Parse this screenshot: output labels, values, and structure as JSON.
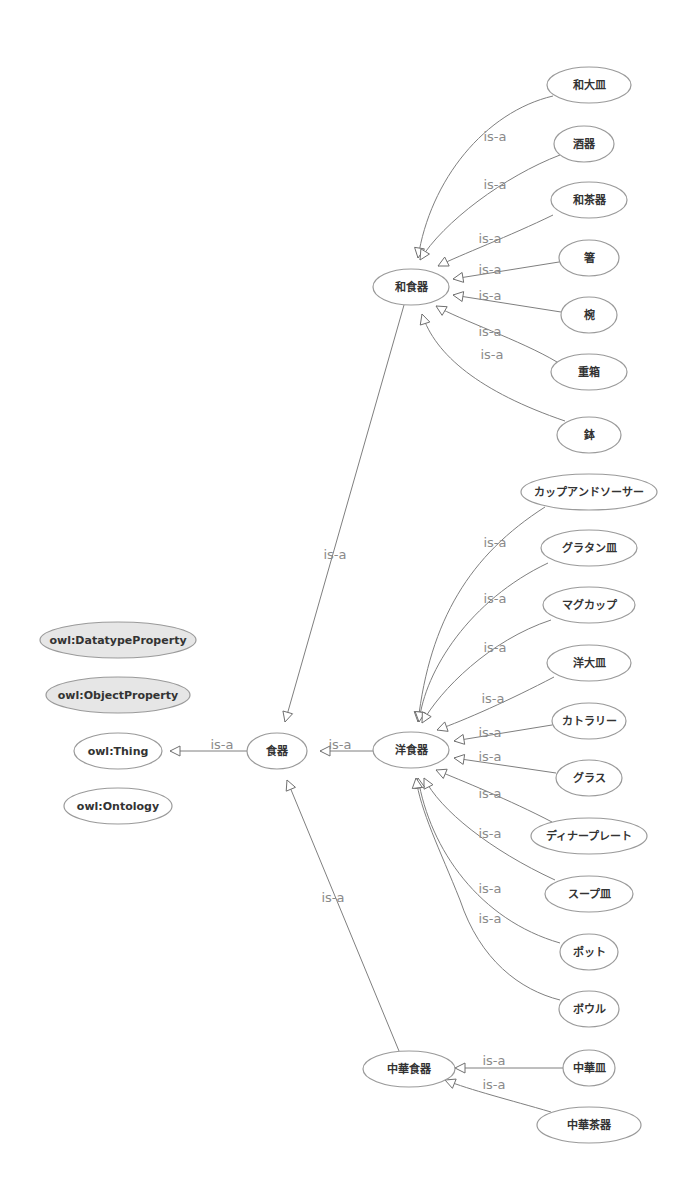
{
  "diagram": {
    "type": "ontology-class-hierarchy",
    "edge_label": "is-a",
    "colors": {
      "background": "#ffffff",
      "node_stroke": "#9a9a9a",
      "node_fill": "#ffffff",
      "property_node_fill": "#e6e6e6",
      "edge": "#7f7f7f",
      "edge_label": "#8a8a8a",
      "node_text": "#333333"
    },
    "nodes": [
      {
        "id": "dtprop",
        "label": "owl:DatatypeProperty",
        "cx": 118,
        "cy": 640,
        "rx": 78,
        "ry": 18,
        "shaded": true
      },
      {
        "id": "objprop",
        "label": "owl:ObjectProperty",
        "cx": 118,
        "cy": 695,
        "rx": 72,
        "ry": 18,
        "shaded": true
      },
      {
        "id": "thing",
        "label": "owl:Thing",
        "cx": 118,
        "cy": 751,
        "rx": 44,
        "ry": 18,
        "shaded": false
      },
      {
        "id": "ontology",
        "label": "owl:Ontology",
        "cx": 118,
        "cy": 806,
        "rx": 54,
        "ry": 18,
        "shaded": false
      },
      {
        "id": "shokki",
        "label": "食器",
        "cx": 277,
        "cy": 751,
        "rx": 30,
        "ry": 18,
        "shaded": false
      },
      {
        "id": "washokki",
        "label": "和食器",
        "cx": 411,
        "cy": 287,
        "rx": 38,
        "ry": 18,
        "shaded": false
      },
      {
        "id": "yoshokki",
        "label": "洋食器",
        "cx": 411,
        "cy": 750,
        "rx": 38,
        "ry": 18,
        "shaded": false
      },
      {
        "id": "chukashokki",
        "label": "中華食器",
        "cx": 409,
        "cy": 1069,
        "rx": 46,
        "ry": 18,
        "shaded": false
      },
      {
        "id": "waozara",
        "label": "和大皿",
        "cx": 589,
        "cy": 85,
        "rx": 42,
        "ry": 18,
        "shaded": false
      },
      {
        "id": "shuki",
        "label": "酒器",
        "cx": 584,
        "cy": 144,
        "rx": 30,
        "ry": 18,
        "shaded": false
      },
      {
        "id": "wachaki",
        "label": "和茶器",
        "cx": 589,
        "cy": 200,
        "rx": 38,
        "ry": 18,
        "shaded": false
      },
      {
        "id": "hashi",
        "label": "箸",
        "cx": 589,
        "cy": 258,
        "rx": 30,
        "ry": 18,
        "shaded": false
      },
      {
        "id": "wan",
        "label": "椀",
        "cx": 589,
        "cy": 315,
        "rx": 28,
        "ry": 18,
        "shaded": false
      },
      {
        "id": "jubako",
        "label": "重箱",
        "cx": 589,
        "cy": 372,
        "rx": 38,
        "ry": 18,
        "shaded": false
      },
      {
        "id": "hachi",
        "label": "鉢",
        "cx": 589,
        "cy": 435,
        "rx": 32,
        "ry": 18,
        "shaded": false
      },
      {
        "id": "cup_saucer",
        "label": "カップアンドソーサー",
        "cx": 589,
        "cy": 492,
        "rx": 68,
        "ry": 18,
        "shaded": false
      },
      {
        "id": "gratin",
        "label": "グラタン皿",
        "cx": 589,
        "cy": 548,
        "rx": 48,
        "ry": 18,
        "shaded": false
      },
      {
        "id": "mug",
        "label": "マグカップ",
        "cx": 589,
        "cy": 605,
        "rx": 46,
        "ry": 18,
        "shaded": false
      },
      {
        "id": "yoozara",
        "label": "洋大皿",
        "cx": 589,
        "cy": 663,
        "rx": 42,
        "ry": 18,
        "shaded": false
      },
      {
        "id": "cutlery",
        "label": "カトラリー",
        "cx": 589,
        "cy": 721,
        "rx": 37,
        "ry": 18,
        "shaded": false
      },
      {
        "id": "glass",
        "label": "グラス",
        "cx": 589,
        "cy": 778,
        "rx": 33,
        "ry": 18,
        "shaded": false
      },
      {
        "id": "dinner",
        "label": "ディナープレート",
        "cx": 589,
        "cy": 836,
        "rx": 58,
        "ry": 18,
        "shaded": false
      },
      {
        "id": "soup",
        "label": "スープ皿",
        "cx": 589,
        "cy": 894,
        "rx": 44,
        "ry": 18,
        "shaded": false
      },
      {
        "id": "pot",
        "label": "ポット",
        "cx": 589,
        "cy": 952,
        "rx": 29,
        "ry": 18,
        "shaded": false
      },
      {
        "id": "bowl",
        "label": "ボウル",
        "cx": 589,
        "cy": 1009,
        "rx": 30,
        "ry": 18,
        "shaded": false
      },
      {
        "id": "chukazara",
        "label": "中華皿",
        "cx": 589,
        "cy": 1068,
        "rx": 26,
        "ry": 18,
        "shaded": false
      },
      {
        "id": "chukachaki",
        "label": "中華茶器",
        "cx": 589,
        "cy": 1125,
        "rx": 52,
        "ry": 18,
        "shaded": false
      }
    ],
    "edges": [
      {
        "from": "shokki",
        "to": "thing",
        "label": "is-a",
        "path": "M247,751 L170,751",
        "lx": 222,
        "ly": 744
      },
      {
        "from": "yoshokki",
        "to": "shokki",
        "label": "is-a",
        "path": "M373,751 L320,751",
        "lx": 340,
        "ly": 744
      },
      {
        "from": "washokki",
        "to": "shokki",
        "label": "is-a",
        "path": "M404,305 L285,722",
        "lx": 335,
        "ly": 554
      },
      {
        "from": "chukashokki",
        "to": "shokki",
        "label": "is-a",
        "path": "M399,1051 L287,780",
        "lx": 333,
        "ly": 897
      },
      {
        "from": "waozara",
        "to": "washokki",
        "label": "is-a",
        "path": "M553,96 C485,112 430,180 418,258",
        "lx": 495,
        "ly": 136
      },
      {
        "from": "shuki",
        "to": "washokki",
        "label": "is-a",
        "path": "M560,155 C505,176 443,222 420,260",
        "lx": 495,
        "ly": 184
      },
      {
        "from": "wachaki",
        "to": "washokki",
        "label": "is-a",
        "path": "M553,215 C510,236 460,255 438,266",
        "lx": 490,
        "ly": 238
      },
      {
        "from": "hashi",
        "to": "washokki",
        "label": "is-a",
        "path": "M559,262 L453,279",
        "lx": 490,
        "ly": 269
      },
      {
        "from": "wan",
        "to": "washokki",
        "label": "is-a",
        "path": "M561,312 L453,295",
        "lx": 490,
        "ly": 295
      },
      {
        "from": "jubako",
        "to": "washokki",
        "label": "is-a",
        "path": "M557,362 C520,340 460,320 436,306",
        "lx": 490,
        "ly": 331
      },
      {
        "from": "hachi",
        "to": "washokki",
        "label": "is-a",
        "path": "M565,421 C480,392 435,355 422,314",
        "lx": 492,
        "ly": 354
      },
      {
        "from": "cup_saucer",
        "to": "yoshokki",
        "label": "is-a",
        "path": "M545,507 C470,555 430,620 418,722",
        "lx": 495,
        "ly": 542
      },
      {
        "from": "gratin",
        "to": "yoshokki",
        "label": "is-a",
        "path": "M548,563 C470,600 425,670 419,722",
        "lx": 495,
        "ly": 598
      },
      {
        "from": "mug",
        "to": "yoshokki",
        "label": "is-a",
        "path": "M551,620 C490,640 440,690 422,723",
        "lx": 495,
        "ly": 647
      },
      {
        "from": "yoozara",
        "to": "yoshokki",
        "label": "is-a",
        "path": "M554,677 C510,700 465,720 437,730",
        "lx": 493,
        "ly": 698
      },
      {
        "from": "cutlery",
        "to": "yoshokki",
        "label": "is-a",
        "path": "M552,725 L454,741",
        "lx": 490,
        "ly": 732
      },
      {
        "from": "glass",
        "to": "yoshokki",
        "label": "is-a",
        "path": "M556,773 L454,758",
        "lx": 490,
        "ly": 756
      },
      {
        "from": "dinner",
        "to": "yoshokki",
        "label": "is-a",
        "path": "M552,822 C510,800 460,780 436,770",
        "lx": 490,
        "ly": 793
      },
      {
        "from": "soup",
        "to": "yoshokki",
        "label": "is-a",
        "path": "M555,880 C490,850 440,810 424,778",
        "lx": 490,
        "ly": 833
      },
      {
        "from": "pot",
        "to": "yoshokki",
        "label": "is-a",
        "path": "M560,943 C480,920 430,850 418,778",
        "lx": 490,
        "ly": 888
      },
      {
        "from": "bowl",
        "to": "yoshokki",
        "label": "is-a",
        "path": "M560,1000 C520,990 480,960 460,900 C440,850 420,810 416,778",
        "lx": 490,
        "ly": 918
      },
      {
        "from": "chukazara",
        "to": "chukashokki",
        "label": "is-a",
        "path": "M563,1068 L455,1068",
        "lx": 494,
        "ly": 1060
      },
      {
        "from": "chukachaki",
        "to": "chukashokki",
        "label": "is-a",
        "path": "M551,1112 C510,1100 470,1090 445,1080",
        "lx": 494,
        "ly": 1084
      }
    ]
  }
}
